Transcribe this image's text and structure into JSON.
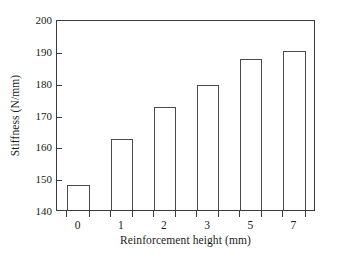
{
  "chart_data": {
    "type": "bar",
    "title": "",
    "xlabel": "Reinforcement height (mm)",
    "ylabel": "Stiffness (N/mm)",
    "categories": [
      "0",
      "1",
      "2",
      "3",
      "5",
      "7"
    ],
    "values": [
      148.0,
      162.2,
      172.3,
      179.3,
      187.4,
      190.0
    ],
    "ylim": [
      140,
      200
    ],
    "yticks": [
      140,
      150,
      160,
      170,
      180,
      190,
      200
    ],
    "ytick_labels": [
      "140",
      "150",
      "160",
      "170",
      "180",
      "190",
      "200"
    ],
    "grid": false,
    "legend": null,
    "bar_fill_color": "#ffffff",
    "bar_edge_color": "#4a4a4a",
    "axis_color": "#3b3b3b",
    "background_color": "#ffffff",
    "bar_width_fraction": 0.52,
    "tick_direction": "in",
    "xtick_position": "bar-edges"
  }
}
